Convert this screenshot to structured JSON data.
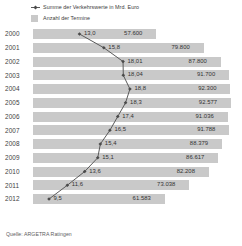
{
  "legend": [
    {
      "marker": "line-marker-icon",
      "label": "Summe der Verkehrswerte in Mrd. Euro"
    },
    {
      "marker": "swatch-icon",
      "label": "Anzahl der Termine"
    }
  ],
  "source": "Quelle: ARGETRA Ratingen",
  "colors": {
    "bar": "#c9c9c9",
    "line": "#5a5a5a",
    "text": "#3a3a3a",
    "background": "#ffffff"
  },
  "chart_data": {
    "type": "bar",
    "title": "",
    "xlabel": "",
    "ylabel": "",
    "grid": false,
    "legend_position": "top-left",
    "categories": [
      "2000",
      "2001",
      "2002",
      "2003",
      "2004",
      "2005",
      "2006",
      "2007",
      "2008",
      "2009",
      "2010",
      "2011",
      "2012"
    ],
    "series": [
      {
        "name": "Anzahl der Termine",
        "type": "bar",
        "values": [
          57600,
          79800,
          87800,
          91700,
          92300,
          92577,
          91036,
          91788,
          88379,
          86617,
          82208,
          73038,
          61583
        ],
        "labels": [
          "57.600",
          "79.800",
          "87.800",
          "91.700",
          "92.300",
          "92.577",
          "91.036",
          "91.788",
          "88.379",
          "86.617",
          "82.208",
          "73.038",
          "61.583"
        ]
      },
      {
        "name": "Summe der Verkehrswerte in Mrd. Euro",
        "type": "line",
        "values": [
          13.0,
          15.8,
          18.01,
          18.04,
          18.8,
          18.3,
          17.4,
          16.5,
          15.4,
          15.1,
          13.6,
          11.6,
          9.5
        ],
        "labels": [
          "13,0",
          "15,8",
          "18,01",
          "18,04",
          "18,8",
          "18,3",
          "17,4",
          "16,5",
          "15,4",
          "15,1",
          "13,6",
          "11,6",
          "9,5"
        ]
      }
    ],
    "bar_xlim": [
      0,
      95000
    ],
    "line_xlim": [
      8.0,
      19.5
    ]
  }
}
